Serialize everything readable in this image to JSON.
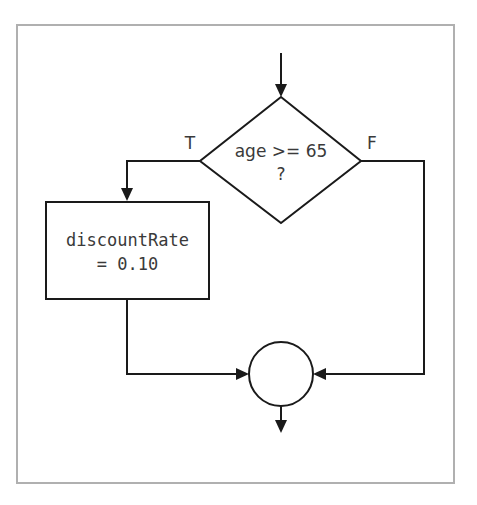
{
  "diagram": {
    "type": "flowchart",
    "decision": {
      "line1": "age >= 65",
      "line2": "?"
    },
    "true_label": "T",
    "false_label": "F",
    "process": {
      "line1": "discountRate",
      "line2": "= 0.10"
    },
    "connector": "merge-circle",
    "colors": {
      "frame": "#b0b0b0",
      "stroke": "#1a1a1a",
      "text": "#3a3a3a"
    }
  }
}
